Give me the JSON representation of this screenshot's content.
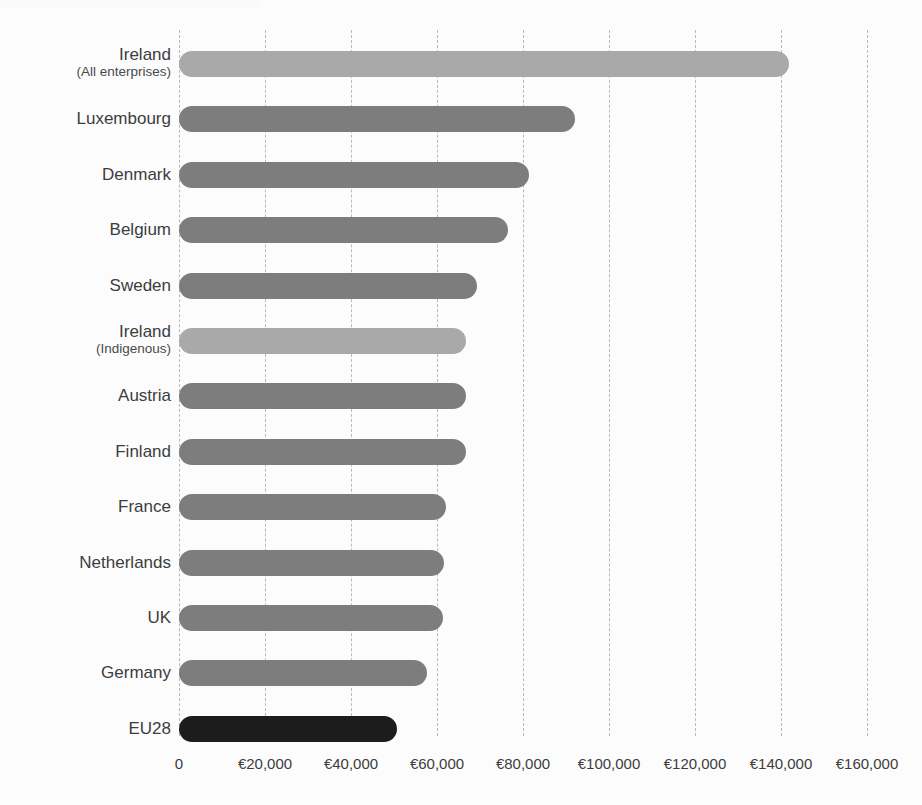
{
  "chart_data": {
    "type": "bar",
    "orientation": "horizontal",
    "title": "",
    "subtitle": "",
    "xlabel": "",
    "ylabel": "",
    "xlim": [
      0,
      160000
    ],
    "grid": true,
    "grid_style": "dashed-vertical",
    "legend": "none",
    "currency_symbol": "€",
    "categories": [
      "Ireland (All enterprises)",
      "Luxembourg",
      "Denmark",
      "Belgium",
      "Sweden",
      "Ireland (Indigenous)",
      "Austria",
      "Finland",
      "France",
      "Netherlands",
      "UK",
      "Germany",
      "EU28"
    ],
    "values": [
      141900,
      92100,
      81400,
      76500,
      69300,
      66700,
      66700,
      66700,
      62100,
      61600,
      61400,
      57700,
      50700
    ],
    "tick_values": [
      0,
      20000,
      40000,
      60000,
      80000,
      100000,
      120000,
      140000,
      160000
    ],
    "tick_labels": [
      "0",
      "€20,000",
      "€40,000",
      "€60,000",
      "€80,000",
      "€100,000",
      "€120,000",
      "€140,000",
      "€160,000"
    ],
    "colors": {
      "default_bar": "#7d7d7d",
      "highlight_bar": "#a9a9a9",
      "accent_bar": "#1c1c1c",
      "gridline": "#b9b9b9",
      "background": "#fcfcfc",
      "text": "#3d3d3d"
    }
  },
  "bars": [
    {
      "label": "Ireland",
      "sublabel": "(All enterprises)",
      "value": 141900,
      "style": "light"
    },
    {
      "label": "Luxembourg",
      "sublabel": "",
      "value": 92100,
      "style": "default"
    },
    {
      "label": "Denmark",
      "sublabel": "",
      "value": 81400,
      "style": "default"
    },
    {
      "label": "Belgium",
      "sublabel": "",
      "value": 76500,
      "style": "default"
    },
    {
      "label": "Sweden",
      "sublabel": "",
      "value": 69300,
      "style": "default"
    },
    {
      "label": "Ireland",
      "sublabel": "(Indigenous)",
      "value": 66700,
      "style": "light"
    },
    {
      "label": "Austria",
      "sublabel": "",
      "value": 66700,
      "style": "default"
    },
    {
      "label": "Finland",
      "sublabel": "",
      "value": 66700,
      "style": "default"
    },
    {
      "label": "France",
      "sublabel": "",
      "value": 62100,
      "style": "default"
    },
    {
      "label": "Netherlands",
      "sublabel": "",
      "value": 61600,
      "style": "default"
    },
    {
      "label": "UK",
      "sublabel": "",
      "value": 61400,
      "style": "default"
    },
    {
      "label": "Germany",
      "sublabel": "",
      "value": 57700,
      "style": "default"
    },
    {
      "label": "EU28",
      "sublabel": "",
      "value": 50700,
      "style": "accent"
    }
  ]
}
